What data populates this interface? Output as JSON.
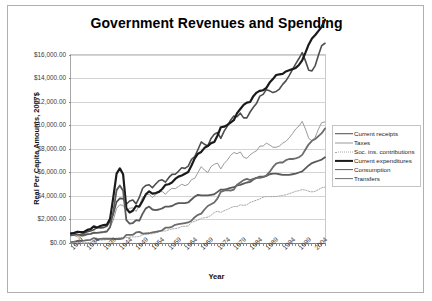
{
  "chart_data": {
    "type": "line",
    "title": "Government Revenues and Spending",
    "xlabel": "Year",
    "ylabel": "Real Per Capita Amounts, 2007$",
    "grid": true,
    "legend_position": "right",
    "xlim": [
      1929,
      2007
    ],
    "ylim": [
      0,
      16000
    ],
    "y_ticks": [
      0,
      2000,
      4000,
      6000,
      8000,
      10000,
      12000,
      14000,
      16000
    ],
    "y_tick_labels": [
      "$0.00",
      "$2,000.00",
      "$4,000.00",
      "$6,000.00",
      "$8,000.00",
      "$10,000.00",
      "$12,000.00",
      "$14,000.00",
      "$16,000.00"
    ],
    "x_tick_labels": [
      "1929",
      "1934",
      "1939",
      "1944",
      "1949",
      "1954",
      "1959",
      "1964",
      "1969",
      "1974",
      "1979",
      "1984",
      "1989",
      "1994",
      "1999",
      "2004"
    ],
    "x": [
      1929,
      1930,
      1931,
      1932,
      1933,
      1934,
      1935,
      1936,
      1937,
      1938,
      1939,
      1940,
      1941,
      1942,
      1943,
      1944,
      1945,
      1946,
      1947,
      1948,
      1949,
      1950,
      1951,
      1952,
      1953,
      1954,
      1955,
      1956,
      1957,
      1958,
      1959,
      1960,
      1961,
      1962,
      1963,
      1964,
      1965,
      1966,
      1967,
      1968,
      1969,
      1970,
      1971,
      1972,
      1973,
      1974,
      1975,
      1976,
      1977,
      1978,
      1979,
      1980,
      1981,
      1982,
      1983,
      1984,
      1985,
      1986,
      1987,
      1988,
      1989,
      1990,
      1991,
      1992,
      1993,
      1994,
      1995,
      1996,
      1997,
      1998,
      1999,
      2000,
      2001,
      2002,
      2003,
      2004,
      2005,
      2006,
      2007
    ],
    "series": [
      {
        "name": "Current receipts",
        "color": "#4d4d4d",
        "width": 1.6,
        "dash": "none",
        "values": [
          880,
          820,
          700,
          720,
          830,
          960,
          1020,
          1120,
          1330,
          1290,
          1310,
          1430,
          1860,
          2460,
          3500,
          3800,
          3780,
          3300,
          3570,
          3660,
          3330,
          3900,
          4660,
          4900,
          4960,
          4700,
          5020,
          5300,
          5380,
          5180,
          5560,
          5840,
          5850,
          6100,
          6400,
          6350,
          6550,
          7120,
          7350,
          7960,
          8600,
          8400,
          8250,
          8900,
          9250,
          9400,
          8900,
          9500,
          9950,
          10450,
          10800,
          10750,
          11050,
          10650,
          10650,
          11150,
          11550,
          11900,
          12500,
          12650,
          13050,
          12950,
          12800,
          12900,
          13100,
          13500,
          13800,
          14250,
          14750,
          15250,
          15700,
          16200,
          15500,
          14700,
          14650,
          15100,
          16000,
          16800,
          17000
        ]
      },
      {
        "name": "Taxes",
        "color": "#9a9a9a",
        "width": 1.0,
        "dash": "none",
        "values": [
          700,
          640,
          520,
          530,
          600,
          700,
          740,
          820,
          900,
          860,
          880,
          960,
          1350,
          1950,
          2950,
          3250,
          3200,
          2750,
          2950,
          3000,
          2680,
          3200,
          3900,
          4120,
          4150,
          3860,
          4120,
          4350,
          4380,
          4150,
          4450,
          4650,
          4620,
          4800,
          5000,
          4880,
          5000,
          5400,
          5500,
          6000,
          6500,
          6200,
          6000,
          6500,
          6700,
          6800,
          6300,
          6750,
          7050,
          7450,
          7700,
          7600,
          7750,
          7300,
          7200,
          7500,
          7700,
          7850,
          8250,
          8250,
          8500,
          8350,
          8150,
          8150,
          8250,
          8500,
          8650,
          8950,
          9300,
          9700,
          9950,
          10350,
          9700,
          8900,
          8700,
          9000,
          9700,
          10250,
          10300
        ]
      },
      {
        "name": "Soc. ins. contributions",
        "color": "#a8a8a8",
        "width": 1.0,
        "dash": "1.4,1.4",
        "values": [
          20,
          20,
          20,
          20,
          20,
          30,
          60,
          110,
          230,
          250,
          260,
          280,
          320,
          360,
          420,
          450,
          460,
          450,
          500,
          520,
          520,
          560,
          700,
          740,
          790,
          790,
          860,
          960,
          1020,
          1020,
          1120,
          1200,
          1220,
          1280,
          1400,
          1420,
          1450,
          1750,
          1850,
          1950,
          2100,
          2150,
          2200,
          2350,
          2600,
          2700,
          2600,
          2750,
          2850,
          3000,
          3100,
          3100,
          3250,
          3200,
          3250,
          3450,
          3550,
          3650,
          3750,
          3900,
          3950,
          3950,
          3950,
          3950,
          4000,
          4050,
          4100,
          4200,
          4300,
          4400,
          4450,
          4550,
          4500,
          4400,
          4350,
          4400,
          4550,
          4700,
          4750
        ]
      },
      {
        "name": "Current expenditures",
        "color": "#1a1a1a",
        "width": 2.2,
        "dash": "none",
        "values": [
          780,
          860,
          960,
          930,
          950,
          1120,
          1180,
          1420,
          1310,
          1450,
          1520,
          1560,
          2050,
          3900,
          5900,
          6350,
          5850,
          2950,
          2600,
          2750,
          3150,
          3100,
          3600,
          4150,
          4400,
          4200,
          4250,
          4350,
          4600,
          4950,
          5000,
          5150,
          5450,
          5650,
          5750,
          5900,
          6050,
          6600,
          7200,
          7600,
          7750,
          8100,
          8250,
          8500,
          8600,
          9150,
          9850,
          9900,
          10050,
          10250,
          10450,
          11050,
          11400,
          11750,
          11950,
          12000,
          12500,
          12800,
          12950,
          13000,
          13200,
          13650,
          13950,
          14300,
          14350,
          14400,
          14600,
          14700,
          14800,
          14900,
          15150,
          15550,
          16200,
          16900,
          17400,
          17700,
          18050,
          18400,
          19000
        ]
      },
      {
        "name": "Consumption",
        "color": "#5a5a5a",
        "width": 1.8,
        "dash": "none",
        "values": [
          640,
          700,
          740,
          680,
          670,
          760,
          780,
          880,
          860,
          910,
          940,
          980,
          1350,
          2700,
          4500,
          4900,
          4450,
          1950,
          1650,
          1700,
          1950,
          1900,
          2500,
          2950,
          3100,
          2850,
          2800,
          2850,
          2950,
          3100,
          3100,
          3150,
          3300,
          3400,
          3400,
          3400,
          3450,
          3700,
          3950,
          4100,
          4050,
          4050,
          4050,
          4100,
          4150,
          4350,
          4550,
          4550,
          4600,
          4700,
          4750,
          4900,
          4950,
          5050,
          5150,
          5200,
          5400,
          5550,
          5650,
          5650,
          5700,
          5850,
          5900,
          5900,
          5850,
          5800,
          5800,
          5800,
          5850,
          5900,
          6000,
          6100,
          6350,
          6600,
          6800,
          6900,
          7000,
          7100,
          7300
        ]
      },
      {
        "name": "Transfers",
        "color": "#6b6b6b",
        "width": 1.8,
        "dash": "none",
        "values": [
          80,
          110,
          160,
          180,
          200,
          250,
          270,
          420,
          300,
          350,
          360,
          370,
          360,
          350,
          340,
          340,
          400,
          700,
          700,
          700,
          900,
          950,
          800,
          820,
          830,
          900,
          950,
          1000,
          1080,
          1300,
          1300,
          1380,
          1550,
          1600,
          1650,
          1700,
          1750,
          1900,
          2200,
          2400,
          2500,
          2850,
          3150,
          3300,
          3450,
          3800,
          4350,
          4450,
          4500,
          4450,
          4550,
          4950,
          5150,
          5350,
          5450,
          5350,
          5450,
          5550,
          5550,
          5600,
          5750,
          6050,
          6450,
          6750,
          6850,
          6850,
          7050,
          7150,
          7150,
          7200,
          7300,
          7500,
          7950,
          8400,
          8700,
          8850,
          9100,
          9350,
          9750
        ]
      }
    ]
  },
  "chart": {
    "title": "Government Revenues and Spending",
    "yaxis_title": "Real Per Capita Amounts, 2007$",
    "xaxis_title": "Year"
  },
  "legend": {
    "items": [
      {
        "label": "Current receipts"
      },
      {
        "label": "Taxes"
      },
      {
        "label": "Soc. ins. contributions"
      },
      {
        "label": "Current expenditures"
      },
      {
        "label": "Consumption"
      },
      {
        "label": "Transfers"
      }
    ]
  }
}
